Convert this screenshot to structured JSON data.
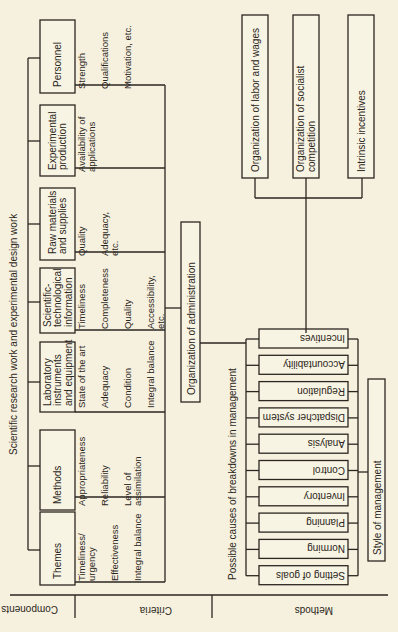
{
  "title": "Scientific research work and experimental design work",
  "axis_labels": {
    "components": "Components",
    "criteria": "Criteria",
    "methods": "Methods"
  },
  "components": [
    {
      "label": [
        "Personnel"
      ],
      "criteria": [
        "Strength",
        "Qualifications",
        "Motivation, etc."
      ]
    },
    {
      "label": [
        "Experimental",
        "production"
      ],
      "criteria": [
        "Availability of",
        "applications"
      ]
    },
    {
      "label": [
        "Raw materials",
        "and supplies"
      ],
      "criteria": [
        "Quality",
        "Adequacy,",
        "etc."
      ]
    },
    {
      "label": [
        "Scientific-",
        "technological",
        "information"
      ],
      "criteria": [
        "Timeliness",
        "Completeness",
        "Quality",
        "Accessibility,",
        "etc."
      ]
    },
    {
      "label": [
        "Laboratory",
        "instruments",
        "and equipment"
      ],
      "criteria": [
        "State of the art",
        "Adequacy",
        "Condition",
        "Integral balance"
      ]
    },
    {
      "label": [
        "Methods"
      ],
      "criteria": [
        "Appropriateness",
        "Reliability",
        "Level of",
        "assimilation"
      ]
    },
    {
      "label": [
        "Themes"
      ],
      "criteria": [
        "Timeliness/",
        "urgency",
        "Effectiveness",
        "Integral balance"
      ]
    }
  ],
  "organization_of_administration": "Organization of administration",
  "breakdowns_caption": "Possible causes of breakdowns in management",
  "management_functions": [
    "Incentives",
    "Accountability",
    "Regulation",
    "Dispatcher system",
    "Analysis",
    "Control",
    "Inventory",
    "Planning",
    "Norming",
    "Setting of goals"
  ],
  "style_of_management": "Style of management",
  "incentive_types": [
    "Organization of labor and wages",
    [
      "Organization of socialist",
      "competition"
    ],
    "Intrinsic incentives"
  ]
}
